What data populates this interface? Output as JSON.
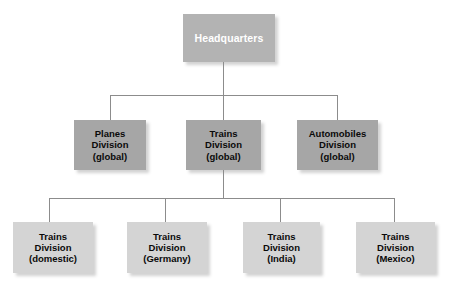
{
  "diagram": {
    "colors": {
      "background": "#ffffff",
      "headquarters_fill": "#b3b3b3",
      "headquarters_text": "#ffffff",
      "division_fill": "#a6a6a6",
      "division_text": "#0a0a0a",
      "subdivision_fill": "#d4d4d4",
      "subdivision_text": "#0a0a0a",
      "connector": "#8c8c8c"
    },
    "levels": {
      "root": {
        "label": "Headquarters"
      },
      "divisions": [
        {
          "label": "Planes\nDivision\n(global)"
        },
        {
          "label": "Trains\nDivision\n(global)"
        },
        {
          "label": "Automobiles\nDivision\n(global)"
        }
      ],
      "subdivisions": [
        {
          "label": "Trains\nDivision\n(domestic)"
        },
        {
          "label": "Trains\nDivision\n(Germany)"
        },
        {
          "label": "Trains\nDivision\n(India)"
        },
        {
          "label": "Trains\nDivision\n(Mexico)"
        }
      ]
    }
  }
}
